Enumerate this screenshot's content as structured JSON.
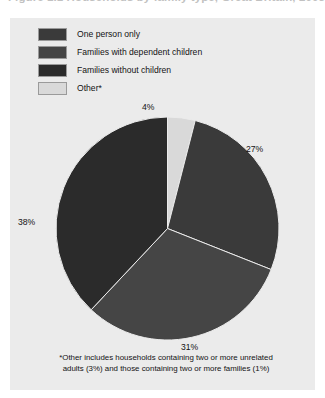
{
  "figure": {
    "title_partial": "Figure 1.1  Households by family type, Great Britain, 2005",
    "panel_color": "#ebebeb"
  },
  "legend": {
    "items": [
      {
        "label": "One person only",
        "color": "#3a3a3a",
        "swatch_name": "legend-swatch-one-person-only"
      },
      {
        "label": "Families with dependent children",
        "color": "#454545",
        "swatch_name": "legend-swatch-families-with-dependent-children"
      },
      {
        "label": "Families without children",
        "color": "#2b2b2b",
        "swatch_name": "legend-swatch-families-without-children"
      },
      {
        "label": "Other*",
        "color": "#d9d9d9",
        "swatch_name": "legend-swatch-other"
      }
    ]
  },
  "labels": {
    "other": "4%",
    "one_person_only": "27%",
    "families_without_children": "38%",
    "families_with_dependent_children": "31%"
  },
  "footnote": {
    "line1": "*Other includes households containing two or more unrelated",
    "line2": "adults (3%) and those containing two or more families (1%)"
  },
  "chart_data": {
    "type": "pie",
    "title": "Households by family type",
    "xlabel": "",
    "ylabel": "",
    "units": "percent",
    "start_angle_deg": 0,
    "direction": "clockwise",
    "legend_position": "top-left",
    "grid": false,
    "categories": [
      "Other*",
      "One person only",
      "Families with dependent children",
      "Families without children"
    ],
    "values": [
      4,
      27,
      31,
      38
    ],
    "colors": [
      "#d9d9d9",
      "#3a3a3a",
      "#454545",
      "#2b2b2b"
    ],
    "data_labels": [
      "4%",
      "27%",
      "31%",
      "38%"
    ],
    "notes": "*Other includes households containing two or more unrelated adults (3%) and those containing two or more families (1%)"
  }
}
